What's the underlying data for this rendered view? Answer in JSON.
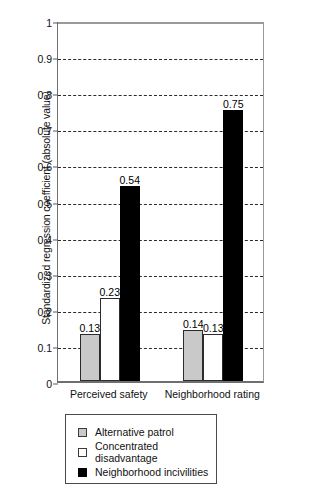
{
  "chart_data": {
    "type": "bar",
    "title": "",
    "xlabel": "",
    "ylabel": "Standardized regression coefficient (absolute value)",
    "ylim": [
      0,
      1
    ],
    "yticks": [
      "0",
      "0.1",
      "0.2",
      "0.3",
      "0.4",
      "0.5",
      "0.6",
      "0.7",
      "0.8",
      "0.9",
      "1"
    ],
    "ytick_values": [
      0,
      0.1,
      0.2,
      0.3,
      0.4,
      0.5,
      0.6,
      0.7,
      0.8,
      0.9,
      1
    ],
    "grid": true,
    "grid_style": "dashed-horizontal",
    "legend_position": "below-plot",
    "categories": [
      "Perceived safety",
      "Neighborhood rating"
    ],
    "series": [
      {
        "name": "Alternative patrol",
        "color": "#c9c9c9",
        "values": [
          0.13,
          0.14
        ],
        "labels": [
          "0.13",
          "0.14"
        ]
      },
      {
        "name": "Concentrated disadvantage",
        "color": "#ffffff",
        "values": [
          0.23,
          0.13
        ],
        "labels": [
          "0.23",
          "0.13"
        ]
      },
      {
        "name": "Neighborhood incivilities",
        "color": "#000000",
        "values": [
          0.54,
          0.75
        ],
        "labels": [
          "0.54",
          "0.75"
        ]
      }
    ]
  }
}
